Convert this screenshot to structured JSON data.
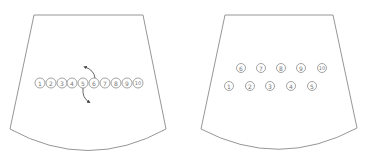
{
  "diagram": {
    "panels": [
      {
        "id": "left",
        "description": "Ten numbered circles packed in a single row with two curved arrows indicating rearrangement",
        "circles": [
          {
            "label": "1",
            "cx": 40,
            "cy": 83
          },
          {
            "label": "2",
            "cx": 51,
            "cy": 83
          },
          {
            "label": "3",
            "cx": 62,
            "cy": 83
          },
          {
            "label": "4",
            "cx": 72,
            "cy": 83
          },
          {
            "label": "5",
            "cx": 83,
            "cy": 83
          },
          {
            "label": "6",
            "cx": 94,
            "cy": 83
          },
          {
            "label": "7",
            "cx": 105,
            "cy": 83
          },
          {
            "label": "8",
            "cx": 116,
            "cy": 83
          },
          {
            "label": "9",
            "cx": 127,
            "cy": 83
          },
          {
            "label": "10",
            "cx": 138,
            "cy": 83
          }
        ],
        "arrows": [
          "from circle 6 curving upward-left",
          "from circle 5 curving downward-right"
        ]
      },
      {
        "id": "right",
        "description": "Ten numbered circles arranged in two staggered rows",
        "circles": [
          {
            "label": "6",
            "cx": 241,
            "cy": 68
          },
          {
            "label": "7",
            "cx": 261,
            "cy": 68
          },
          {
            "label": "8",
            "cx": 281,
            "cy": 68
          },
          {
            "label": "9",
            "cx": 301,
            "cy": 68
          },
          {
            "label": "10",
            "cx": 322,
            "cy": 68
          },
          {
            "label": "1",
            "cx": 229,
            "cy": 86
          },
          {
            "label": "2",
            "cx": 250,
            "cy": 86
          },
          {
            "label": "3",
            "cx": 270,
            "cy": 86
          },
          {
            "label": "4",
            "cx": 291,
            "cy": 86
          },
          {
            "label": "5",
            "cx": 312,
            "cy": 86
          }
        ]
      }
    ],
    "colors": {
      "outline": "#8a8a8a",
      "circle_stroke": "#8c8c8c",
      "text": "#777777",
      "arrow": "#555555",
      "background": "#ffffff"
    }
  }
}
